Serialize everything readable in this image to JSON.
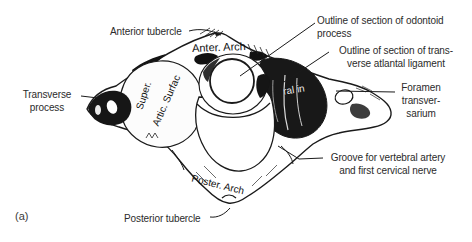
{
  "colors": {
    "background": "#ffffff",
    "ink": "#1a1a1a",
    "label_text": "#2b2b2b",
    "inscription_light": "#f0f0f0"
  },
  "caption": {
    "marker": "(a)"
  },
  "labels": {
    "anterior_tubercle": {
      "text": "Anterior tubercle"
    },
    "odontoid": {
      "line1": "Outline of section of odontoid",
      "line2": "process"
    },
    "ligament": {
      "line1": "Outline of section of trans-",
      "line2": "verse atlantal ligament"
    },
    "foramen": {
      "line1": "Foramen",
      "line2": "transver-",
      "line3": "sarium"
    },
    "transverse": {
      "line1": "Transverse",
      "line2": "process"
    },
    "groove": {
      "line1": "Groove for vertebral artery",
      "line2": "and first cervical nerve"
    },
    "posterior_tubercle": {
      "text": "Posterior tubercle"
    }
  },
  "inscriptions": {
    "anterior_arch": {
      "text": "Anter. Arch"
    },
    "superior_articular": {
      "line1": "Super.",
      "line2": "Artic. Surfac"
    },
    "posterior_arch": {
      "text": "Poster. Arch"
    },
    "lateral_mass": {
      "text": "ral in"
    }
  }
}
